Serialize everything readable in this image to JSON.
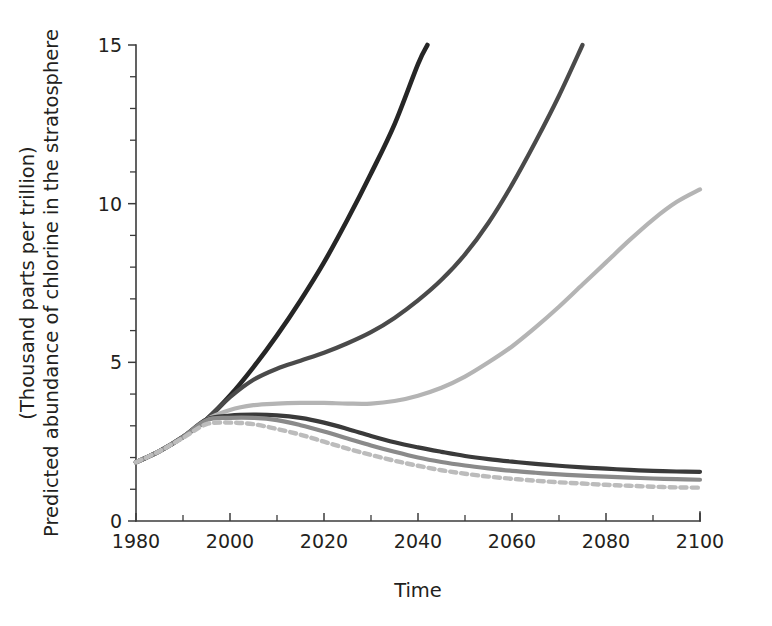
{
  "chart_data": {
    "type": "line",
    "title": "",
    "xlabel": "Time",
    "ylabel": "Predicted abundance of chlorine in the stratosphere (Thousand parts per trillion)",
    "ylabel_line1": "Predicted abundance of chlorine in the stratosphere",
    "ylabel_line2": "(Thousand parts per trillion)",
    "xlim": [
      1980,
      2100
    ],
    "ylim": [
      0,
      15
    ],
    "xticks": [
      1980,
      2000,
      2020,
      2040,
      2060,
      2080,
      2100
    ],
    "xtick_labels": [
      "1980",
      "2000",
      "2020",
      "2040",
      "2060",
      "2080",
      "2100"
    ],
    "x_minor_step": 10,
    "yticks": [
      0,
      5,
      10,
      15
    ],
    "ytick_labels": [
      "0",
      "5",
      "10",
      "15"
    ],
    "y_minor_step": 1,
    "grid": false,
    "legend": "none",
    "series": [
      {
        "name": "No protocol",
        "color": "#262626",
        "width": 4.6,
        "dash": "none",
        "x": [
          1980,
          1985,
          1990,
          1995,
          2000,
          2005,
          2010,
          2015,
          2020,
          2025,
          2030,
          2035,
          2040,
          2042
        ],
        "values": [
          1.85,
          2.2,
          2.65,
          3.2,
          3.95,
          4.85,
          5.85,
          6.95,
          8.15,
          9.5,
          10.95,
          12.5,
          14.4,
          15.0
        ]
      },
      {
        "name": "Montreal 1987",
        "color": "#4a4a4a",
        "width": 4.2,
        "dash": "none",
        "x": [
          1980,
          1985,
          1990,
          1995,
          2000,
          2005,
          2010,
          2015,
          2020,
          2025,
          2030,
          2035,
          2040,
          2045,
          2050,
          2055,
          2060,
          2065,
          2070,
          2075
        ],
        "values": [
          1.85,
          2.2,
          2.65,
          3.2,
          3.9,
          4.45,
          4.8,
          5.05,
          5.3,
          5.6,
          5.95,
          6.4,
          6.95,
          7.6,
          8.4,
          9.4,
          10.6,
          11.95,
          13.4,
          15.0
        ]
      },
      {
        "name": "London 1990",
        "color": "#b4b4b4",
        "width": 4.2,
        "dash": "none",
        "x": [
          1980,
          1985,
          1990,
          1995,
          2000,
          2005,
          2010,
          2015,
          2020,
          2025,
          2030,
          2035,
          2040,
          2045,
          2050,
          2055,
          2060,
          2065,
          2070,
          2075,
          2080,
          2085,
          2090,
          2095,
          2100
        ],
        "values": [
          1.85,
          2.2,
          2.65,
          3.2,
          3.5,
          3.65,
          3.7,
          3.72,
          3.72,
          3.7,
          3.7,
          3.78,
          3.95,
          4.2,
          4.55,
          5.0,
          5.5,
          6.1,
          6.75,
          7.45,
          8.15,
          8.85,
          9.5,
          10.05,
          10.45
        ]
      },
      {
        "name": "Copenhagen 1992",
        "color": "#3a3a3a",
        "width": 4.2,
        "dash": "none",
        "x": [
          1980,
          1985,
          1990,
          1995,
          2000,
          2005,
          2010,
          2015,
          2020,
          2025,
          2030,
          2035,
          2040,
          2045,
          2050,
          2055,
          2060,
          2065,
          2070,
          2075,
          2080,
          2085,
          2090,
          2095,
          2100
        ],
        "values": [
          1.85,
          2.2,
          2.65,
          3.2,
          3.32,
          3.35,
          3.33,
          3.25,
          3.1,
          2.9,
          2.68,
          2.48,
          2.32,
          2.18,
          2.05,
          1.95,
          1.87,
          1.8,
          1.74,
          1.69,
          1.65,
          1.61,
          1.58,
          1.56,
          1.55
        ]
      },
      {
        "name": "Vienna 1995",
        "color": "#8a8a8a",
        "width": 4.2,
        "dash": "none",
        "x": [
          1980,
          1985,
          1990,
          1995,
          2000,
          2005,
          2010,
          2015,
          2020,
          2025,
          2030,
          2035,
          2040,
          2045,
          2050,
          2055,
          2060,
          2065,
          2070,
          2075,
          2080,
          2085,
          2090,
          2095,
          2100
        ],
        "values": [
          1.85,
          2.2,
          2.65,
          3.18,
          3.25,
          3.25,
          3.18,
          3.02,
          2.82,
          2.6,
          2.38,
          2.18,
          2.0,
          1.86,
          1.75,
          1.66,
          1.58,
          1.52,
          1.47,
          1.43,
          1.4,
          1.37,
          1.34,
          1.32,
          1.3
        ]
      },
      {
        "name": "Zero emissions",
        "color": "#bcbcbc",
        "width": 4.4,
        "dash": "6 5",
        "x": [
          1980,
          1985,
          1990,
          1995,
          2000,
          2005,
          2010,
          2015,
          2020,
          2025,
          2030,
          2035,
          2040,
          2045,
          2050,
          2055,
          2060,
          2065,
          2070,
          2075,
          2080,
          2085,
          2090,
          2095,
          2100
        ],
        "values": [
          1.85,
          2.2,
          2.62,
          3.05,
          3.1,
          3.05,
          2.9,
          2.72,
          2.5,
          2.28,
          2.08,
          1.9,
          1.74,
          1.6,
          1.49,
          1.4,
          1.33,
          1.27,
          1.22,
          1.18,
          1.14,
          1.11,
          1.08,
          1.06,
          1.05
        ]
      }
    ]
  },
  "geometry": {
    "plot_left": 136,
    "plot_right": 700,
    "plot_top": 45,
    "plot_bottom": 521,
    "major_tick_len": 8,
    "minor_tick_len": 6
  }
}
